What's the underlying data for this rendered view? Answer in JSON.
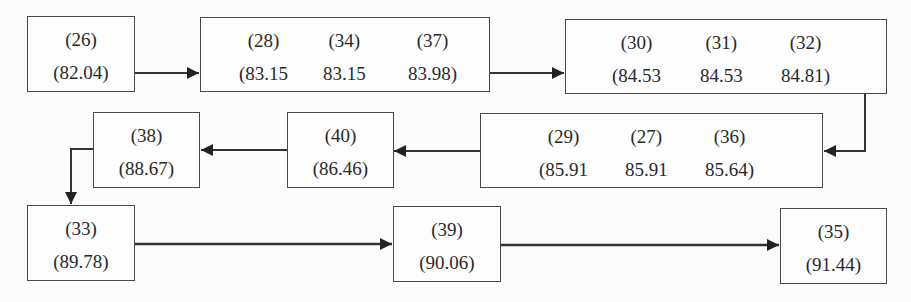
{
  "diagram": {
    "type": "flowchart",
    "nodes": [
      {
        "id": "A",
        "labels": [
          "(26)"
        ],
        "values": [
          "(82.04)"
        ]
      },
      {
        "id": "B",
        "labels": [
          "(28)",
          "(34)",
          "(37)"
        ],
        "values": [
          "(83.15",
          "83.15",
          "83.98)"
        ]
      },
      {
        "id": "C",
        "labels": [
          "(30)",
          "(31)",
          "(32)"
        ],
        "values": [
          "(84.53",
          "84.53",
          "84.81)"
        ]
      },
      {
        "id": "D",
        "labels": [
          "(29)",
          "(27)",
          "(36)"
        ],
        "values": [
          "(85.91",
          "85.91",
          "85.64)"
        ]
      },
      {
        "id": "E",
        "labels": [
          "(40)"
        ],
        "values": [
          "(86.46)"
        ]
      },
      {
        "id": "F",
        "labels": [
          "(38)"
        ],
        "values": [
          "(88.67)"
        ]
      },
      {
        "id": "G",
        "labels": [
          "(33)"
        ],
        "values": [
          "(89.78)"
        ]
      },
      {
        "id": "H",
        "labels": [
          "(39)"
        ],
        "values": [
          "(90.06)"
        ]
      },
      {
        "id": "I",
        "labels": [
          "(35)"
        ],
        "values": [
          "(91.44)"
        ]
      }
    ],
    "edges": [
      [
        "A",
        "B"
      ],
      [
        "B",
        "C"
      ],
      [
        "C",
        "D"
      ],
      [
        "D",
        "E"
      ],
      [
        "E",
        "F"
      ],
      [
        "F",
        "G"
      ],
      [
        "G",
        "H"
      ],
      [
        "H",
        "I"
      ]
    ]
  }
}
